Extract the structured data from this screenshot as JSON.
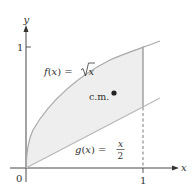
{
  "figure": {
    "axes": {
      "x_label": "x",
      "y_label": "y",
      "origin_label": "0",
      "x_tick_label": "1",
      "y_tick_label": "1"
    },
    "curves": {
      "f": {
        "label_lhs": "f(x) = ",
        "label_rhs": "x",
        "expression": "f(x) = √x"
      },
      "g": {
        "label_lhs": "g(x) = ",
        "numerator": "x",
        "denominator": "2",
        "expression": "g(x) = x/2"
      }
    },
    "center_of_mass_label": "c.m.",
    "colors": {
      "curve": "#a8a8a8",
      "region_fill": "#eeeeee",
      "axis": "#333333",
      "point": "#222222"
    }
  }
}
